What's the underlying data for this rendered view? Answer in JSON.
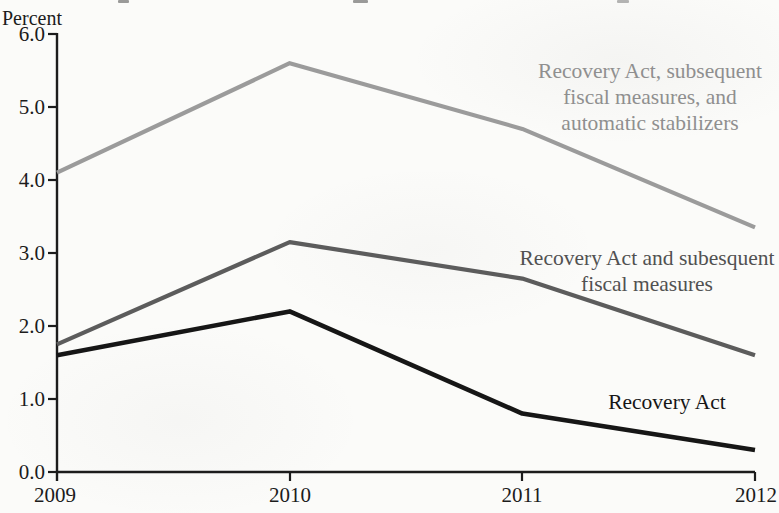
{
  "chart_data": {
    "type": "line",
    "title": "",
    "unit_label": "Percent",
    "x": [
      2009,
      2010,
      2011,
      2012
    ],
    "x_tick_labels": [
      "2009",
      "2010",
      "2011",
      "2012"
    ],
    "y_ticks": [
      "0.0",
      "1.0",
      "2.0",
      "3.0",
      "4.0",
      "5.0",
      "6.0"
    ],
    "ylim": [
      0.0,
      6.0
    ],
    "grid": false,
    "legend_position": "inline-labels",
    "series": [
      {
        "name": "Recovery Act, subsequent fiscal measures, and automatic stabilizers",
        "values": [
          4.1,
          5.6,
          4.7,
          3.35
        ],
        "color": "#9b9b9b",
        "width": 4.2
      },
      {
        "name": "Recovery Act and subesquent fiscal measures",
        "values": [
          1.75,
          3.15,
          2.65,
          1.6
        ],
        "color": "#5c5c5c",
        "width": 4.2
      },
      {
        "name": "Recovery Act",
        "values": [
          1.6,
          2.2,
          0.8,
          0.3
        ],
        "color": "#161616",
        "width": 4.6
      }
    ],
    "annotations": [
      {
        "lines": [
          "Recovery Act, subsequent",
          "fiscal measures, and",
          "automatic stabilizers"
        ],
        "color": "#8f8f8f"
      },
      {
        "lines": [
          "Recovery Act and subesquent",
          "fiscal measures"
        ],
        "color": "#515151"
      },
      {
        "lines": [
          "Recovery Act"
        ],
        "color": "#161616"
      }
    ]
  }
}
